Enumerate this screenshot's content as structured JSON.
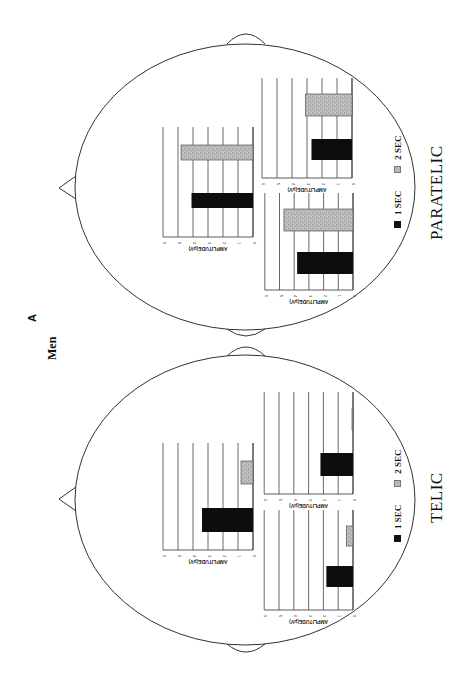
{
  "figure": {
    "panel_letter": "A",
    "panel_title": "Men",
    "orientation": "rotated 90deg counter-clockwise"
  },
  "legend": {
    "items": [
      {
        "label": "1 SEC",
        "color": "#111111"
      },
      {
        "label": "2 SEC",
        "color": "#b4b4b4"
      }
    ]
  },
  "axis": {
    "label": "AMPLITUDE(μV)",
    "ticks": [
      "0",
      "1",
      "2",
      "3",
      "4",
      "5",
      "6"
    ],
    "min": 0,
    "max": 6
  },
  "heads": [
    {
      "condition": "PARATELIC"
    },
    {
      "condition": "TELIC"
    }
  ],
  "chart_data": [
    {
      "type": "bar",
      "title": "PARATELIC - central",
      "categories": [
        "1 SEC",
        "2 SEC"
      ],
      "values": [
        4.1,
        4.8
      ],
      "xlabel": "",
      "ylabel": "AMPLITUDE(μV)",
      "ylim": [
        0,
        6
      ]
    },
    {
      "type": "bar",
      "title": "PARATELIC - lateral 1",
      "categories": [
        "1 SEC",
        "2 SEC"
      ],
      "values": [
        2.7,
        3.1
      ],
      "xlabel": "",
      "ylabel": "AMPLITUDE(μV)",
      "ylim": [
        0,
        6
      ]
    },
    {
      "type": "bar",
      "title": "PARATELIC - lateral 2",
      "categories": [
        "1 SEC",
        "2 SEC"
      ],
      "values": [
        3.8,
        4.7
      ],
      "xlabel": "",
      "ylabel": "AMPLITUDE(μV)",
      "ylim": [
        0,
        6
      ]
    },
    {
      "type": "bar",
      "title": "TELIC - central",
      "categories": [
        "1 SEC",
        "2 SEC"
      ],
      "values": [
        3.4,
        0.8
      ],
      "xlabel": "",
      "ylabel": "AMPLITUDE(μV)",
      "ylim": [
        0,
        6
      ]
    },
    {
      "type": "bar",
      "title": "TELIC - lateral 1",
      "categories": [
        "1 SEC",
        "2 SEC"
      ],
      "values": [
        2.2,
        0.05
      ],
      "xlabel": "",
      "ylabel": "AMPLITUDE(μV)",
      "ylim": [
        0,
        6
      ]
    },
    {
      "type": "bar",
      "title": "TELIC - lateral 2",
      "categories": [
        "1 SEC",
        "2 SEC"
      ],
      "values": [
        1.8,
        0.45
      ],
      "xlabel": "",
      "ylabel": "AMPLITUDE(μV)",
      "ylim": [
        0,
        6
      ]
    }
  ]
}
